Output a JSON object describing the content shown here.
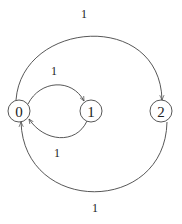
{
  "diagram": {
    "type": "state-transition-graph",
    "colors": {
      "stroke": "#444444",
      "text": "#222222",
      "background": "#ffffff"
    },
    "nodes": [
      {
        "id": "0",
        "label": "0",
        "cx": 19,
        "cy": 111,
        "r": 11
      },
      {
        "id": "1",
        "label": "1",
        "cx": 91,
        "cy": 111,
        "r": 11
      },
      {
        "id": "2",
        "label": "2",
        "cx": 161,
        "cy": 111,
        "r": 11
      }
    ],
    "edges": [
      {
        "from": "0",
        "to": "2",
        "label": "1",
        "label_x": 84,
        "label_y": 14,
        "path": "M 16 100 C 22 20, 160 10, 162 100"
      },
      {
        "from": "0",
        "to": "1",
        "label": "1",
        "label_x": 54,
        "label_y": 71,
        "path": "M 28 104 C 40 80, 72 78, 84 101"
      },
      {
        "from": "1",
        "to": "0",
        "label": "1",
        "label_x": 57,
        "label_y": 153,
        "path": "M 87 121 C 76 145, 44 142, 29 119"
      },
      {
        "from": "2",
        "to": "0",
        "label": "1",
        "label_x": 95,
        "label_y": 208,
        "path": "M 167 122 C 165 215, 24 215, 21 122"
      }
    ]
  }
}
